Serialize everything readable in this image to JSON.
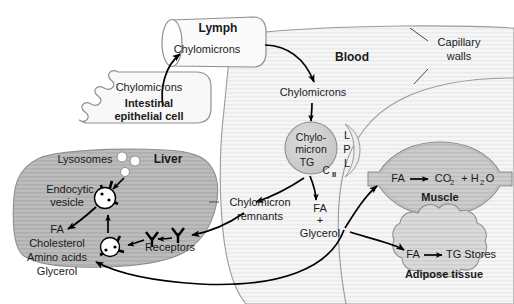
{
  "diagram": {
    "colors": {
      "outline": "#8c8c8c",
      "arrow": "#000000",
      "text": "#1a1a1a",
      "vessel_fill": "#f4f4f4",
      "vessel_stripe": "#e6e6e6",
      "liver_fill": "#b9b9b9",
      "liver_stripe": "#ababab",
      "muscle_fill": "#c9c9c9",
      "adipose_fill": "#d6d6d6",
      "chylomicron_fill": "#cfcfcf",
      "cell_fill": "#f7f7f7",
      "lysosome_fill": "#ffffff",
      "vesicle_fill": "#ffffff"
    },
    "compartments": {
      "lymph": {
        "label": "Lymph",
        "content": "Chylomicrons"
      },
      "intestine": {
        "content": "Chylomicrons",
        "label_line1": "Intestinal",
        "label_line2": "epithelial cell"
      },
      "blood": {
        "label": "Blood",
        "content": "Chylomicrons"
      },
      "capillary": {
        "label_line1": "Capillary",
        "label_line2": "walls"
      },
      "liver": {
        "label": "Liver",
        "lysosomes": "Lysosomes",
        "vesicle_line1": "Endocytic",
        "vesicle_line2": "vesicle",
        "receptors": "Receptors",
        "products": [
          "FA",
          "Cholesterol",
          "Amino acids",
          "Glycerol"
        ]
      },
      "muscle": {
        "label": "Muscle",
        "reaction_in": "FA",
        "reaction_out": "CO",
        "reaction_out_sub": "2",
        "reaction_plus": "+ H",
        "reaction_water_sub": "2",
        "reaction_water_o": "O"
      },
      "adipose": {
        "label": "Adipose tissue",
        "reaction_in": "FA",
        "reaction_out": "TG Stores"
      }
    },
    "particles": {
      "chylomicron": {
        "line1": "Chylo-",
        "line2": "micron",
        "line3": "TG",
        "apo": "C",
        "apo_sub": "II"
      },
      "lpl": {
        "l1": "L",
        "p": "P",
        "l2": "L"
      },
      "remnants_line1": "Chylomicron",
      "remnants_line2": "remnants",
      "products_line1": "FA",
      "products_plus": "+",
      "products_line2": "Glycerol"
    }
  }
}
